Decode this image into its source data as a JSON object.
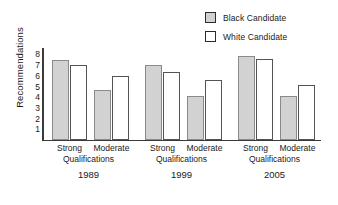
{
  "chart_data": {
    "type": "bar",
    "title": "",
    "xlabel": "",
    "ylabel": "Recommendations",
    "ylim": [
      0,
      8.6
    ],
    "ytick_labels": [
      "8",
      "7",
      "6",
      "5",
      "4",
      "3",
      "2",
      "1"
    ],
    "ytick_values": [
      8,
      7,
      6,
      5,
      4,
      3,
      2,
      1
    ],
    "grid": false,
    "legend_position": "top-right",
    "categories": [
      "1989 Strong Qualifications",
      "1989 Moderate Qualifications",
      "1999 Strong Qualifications",
      "1999 Moderate Qualifications",
      "2005 Strong Qualifications",
      "2005 Moderate Qualifications"
    ],
    "series": [
      {
        "name": "Black Candidate",
        "color": "#d2d2d2",
        "values": [
          7.5,
          4.7,
          7.0,
          4.1,
          7.9,
          4.1
        ]
      },
      {
        "name": "White Candidate",
        "color": "#ffffff",
        "values": [
          7.0,
          6.0,
          6.4,
          5.6,
          7.6,
          5.1
        ]
      }
    ],
    "groups": [
      {
        "year": "1989",
        "qualifications_label": "Qualifications",
        "subgroups": [
          {
            "label": "Strong",
            "black": 7.5,
            "white": 7.0
          },
          {
            "label": "Moderate",
            "black": 4.7,
            "white": 6.0
          }
        ]
      },
      {
        "year": "1999",
        "qualifications_label": "Qualifications",
        "subgroups": [
          {
            "label": "Strong",
            "black": 7.0,
            "white": 6.4
          },
          {
            "label": "Moderate",
            "black": 4.1,
            "white": 5.6
          }
        ]
      },
      {
        "year": "2005",
        "qualifications_label": "Qualifications",
        "subgroups": [
          {
            "label": "Strong",
            "black": 7.9,
            "white": 7.6
          },
          {
            "label": "Moderate",
            "black": 4.1,
            "white": 5.1
          }
        ]
      }
    ]
  },
  "legend": {
    "items": [
      {
        "label": "Black Candidate",
        "swatch": "black-cand"
      },
      {
        "label": "White Candidate",
        "swatch": "white-cand"
      }
    ]
  },
  "axis": {
    "y_title": "Recommendations"
  },
  "colors": {
    "black_candidate_fill": "#d2d2d2",
    "white_candidate_fill": "#ffffff",
    "axis": "#3a3a3a",
    "text": "#1a1a1a"
  }
}
